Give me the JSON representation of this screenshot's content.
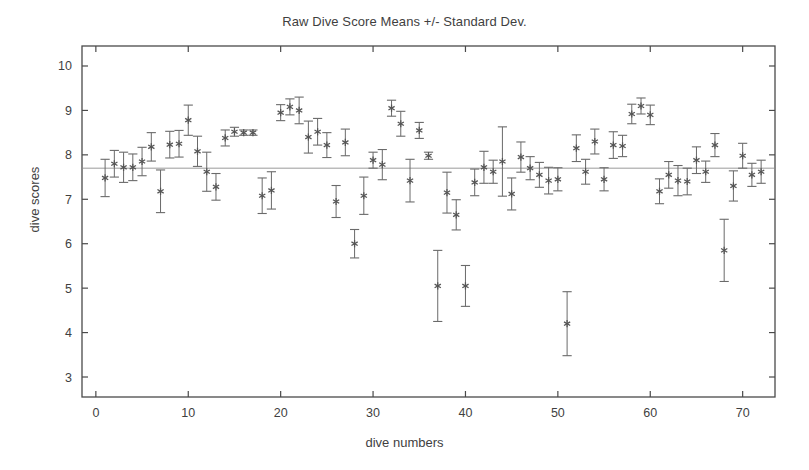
{
  "chart_data": {
    "type": "scatter",
    "title": "Raw Dive Score Means +/- Standard Dev.",
    "xlabel": "dive numbers",
    "ylabel": "dive scores",
    "xlim": [
      -1.5,
      73.5
    ],
    "ylim": [
      2.55,
      10.45
    ],
    "xticks": [
      0,
      10,
      20,
      30,
      40,
      50,
      60,
      70
    ],
    "yticks": [
      3,
      4,
      5,
      6,
      7,
      8,
      9,
      10
    ],
    "grid": false,
    "legend": null,
    "marker": "asterisk",
    "errorbar_style": "vertical-with-caps",
    "reference_line": {
      "orientation": "horizontal",
      "value": 7.7,
      "label": "overall mean"
    },
    "series": [
      {
        "name": "Raw Dive Score Means",
        "x_label": "dive number",
        "y_label": "mean score",
        "error_label": "standard deviation",
        "x": [
          1,
          2,
          3,
          4,
          5,
          6,
          7,
          8,
          9,
          10,
          11,
          12,
          13,
          14,
          15,
          16,
          17,
          18,
          19,
          20,
          21,
          22,
          23,
          24,
          25,
          26,
          27,
          28,
          29,
          30,
          31,
          32,
          33,
          34,
          35,
          36,
          37,
          38,
          39,
          40,
          41,
          42,
          43,
          44,
          45,
          46,
          47,
          48,
          49,
          50,
          51,
          52,
          53,
          54,
          55,
          56,
          57,
          58,
          59,
          60,
          61,
          62,
          63,
          64,
          65,
          66,
          67,
          68,
          69,
          70,
          71,
          72
        ],
        "y": [
          7.48,
          7.8,
          7.72,
          7.72,
          7.85,
          8.18,
          7.18,
          8.23,
          8.25,
          8.78,
          8.08,
          7.62,
          7.28,
          8.38,
          8.52,
          8.5,
          8.5,
          7.08,
          7.2,
          8.95,
          9.08,
          9.0,
          8.4,
          8.52,
          8.22,
          6.95,
          8.28,
          6.0,
          7.08,
          7.88,
          7.78,
          9.05,
          8.7,
          7.42,
          8.55,
          7.98,
          5.05,
          7.15,
          6.65,
          5.05,
          7.38,
          7.72,
          7.62,
          7.85,
          7.12,
          7.95,
          7.7,
          7.55,
          7.42,
          7.45,
          4.2,
          8.15,
          7.62,
          8.3,
          7.45,
          8.22,
          8.2,
          8.92,
          9.1,
          8.9,
          7.18,
          7.55,
          7.42,
          7.4,
          7.88,
          7.62,
          8.22,
          5.85,
          7.3,
          7.98,
          7.55,
          7.62
        ],
        "error": [
          0.42,
          0.3,
          0.34,
          0.3,
          0.32,
          0.32,
          0.48,
          0.3,
          0.3,
          0.34,
          0.34,
          0.44,
          0.3,
          0.18,
          0.1,
          0.06,
          0.06,
          0.4,
          0.42,
          0.18,
          0.18,
          0.3,
          0.36,
          0.3,
          0.28,
          0.36,
          0.3,
          0.32,
          0.42,
          0.18,
          0.34,
          0.18,
          0.28,
          0.48,
          0.18,
          0.08,
          0.8,
          0.46,
          0.34,
          0.46,
          0.3,
          0.36,
          0.26,
          0.78,
          0.36,
          0.34,
          0.26,
          0.28,
          0.3,
          0.26,
          0.72,
          0.3,
          0.28,
          0.28,
          0.26,
          0.3,
          0.24,
          0.22,
          0.18,
          0.22,
          0.28,
          0.3,
          0.34,
          0.3,
          0.3,
          0.24,
          0.26,
          0.7,
          0.34,
          0.28,
          0.26,
          0.26
        ]
      }
    ],
    "colors": {
      "axis": "#4a4a4a",
      "marker": "#555555",
      "errorbar": "#6a6a6a",
      "reference_line": "#9a9a9a",
      "background": "#ffffff",
      "text": "#3f3f3f"
    }
  }
}
